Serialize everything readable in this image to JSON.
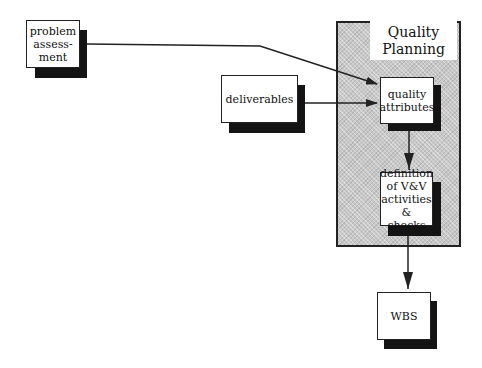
{
  "diagram": {
    "type": "flowchart",
    "panel": {
      "title_line1": "Quality",
      "title_line2": "Planning"
    },
    "nodes": {
      "problem_assessment": {
        "line1": "problem",
        "line2": "assess-",
        "line3": "ment"
      },
      "deliverables": {
        "label": "deliverables"
      },
      "quality_attributes": {
        "line1": "quality",
        "line2": "attributes"
      },
      "definition_vv": {
        "line1": "definition",
        "line2": "of V&V",
        "line3": "activities",
        "line4": "& checks"
      },
      "wbs": {
        "label": "WBS"
      }
    },
    "edges": [
      {
        "from": "problem assessment",
        "to": "quality attributes"
      },
      {
        "from": "deliverables",
        "to": "quality attributes"
      },
      {
        "from": "quality attributes",
        "to": "definition of V&V activities & checks"
      },
      {
        "from": "definition of V&V activities & checks",
        "to": "WBS"
      }
    ],
    "colors": {
      "line": "#222222",
      "shadow": "#141414",
      "panel_fill": "#c8c8c8",
      "box_fill": "#ffffff"
    }
  }
}
